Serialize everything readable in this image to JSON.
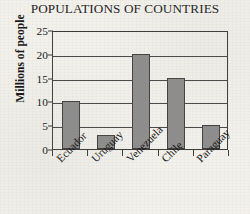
{
  "chart_data": {
    "type": "bar",
    "title": "POPULATIONS OF COUNTRIES",
    "xlabel": "",
    "ylabel": "Millions of people",
    "categories": [
      "Ecuador",
      "Uruguay",
      "Venezuela",
      "Chile",
      "Paraguay"
    ],
    "values": [
      10,
      3,
      20,
      15,
      5
    ],
    "ylim": [
      0,
      25
    ],
    "yticks": [
      0,
      5,
      10,
      15,
      20,
      25
    ],
    "ytick_labels": [
      "0",
      "5",
      "10",
      "15",
      "20",
      "25"
    ],
    "grid": "horizontal",
    "legend": "none",
    "bar_color": "#8d8d8d",
    "bar_edge_color": "#3f3f3f",
    "axis_color": "#3b3b3b",
    "background_color": "#f3f1ec",
    "text_color": "#141414"
  }
}
